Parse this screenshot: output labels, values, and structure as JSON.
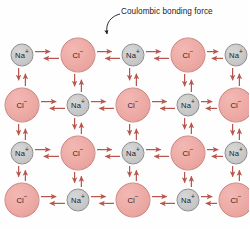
{
  "figure": {
    "width": 249,
    "height": 229,
    "background": "#fefefe"
  },
  "annotation": {
    "label": "Coulombic bonding force",
    "leader_line": {
      "text_anchor_x": 120,
      "text_anchor_y": 14,
      "arrow_tip_x": 108,
      "arrow_tip_y": 40,
      "color": "#1b1b1b"
    }
  },
  "colors": {
    "cation_fill": "#c9c9c9",
    "cation_stroke": "#8d8d8d",
    "anion_fill": "#edaaa5",
    "anion_stroke": "#c8817c",
    "arrow": "#b8564e",
    "text": "#20201f",
    "leader": "#1b1b1b"
  },
  "legend": {
    "cation_symbol": "Na",
    "cation_charge": "+",
    "anion_symbol": "Cl",
    "anion_charge": "−"
  },
  "lattice": {
    "rows": 4,
    "columns": 5,
    "cation_radius": 11.5,
    "anion_radius": 17.5,
    "column_x": [
      22,
      78,
      133,
      188,
      236
    ],
    "row_y": [
      55,
      105,
      153,
      200
    ],
    "ions": [
      [
        {
          "species": "Na+",
          "type": "cation",
          "label": "Na",
          "charge": "+",
          "x": 22,
          "y": 55,
          "r": 11.5
        },
        {
          "species": "Cl-",
          "type": "anion",
          "label": "Cl",
          "charge": "−",
          "x": 78,
          "y": 55,
          "r": 17.5
        },
        {
          "species": "Na+",
          "type": "cation",
          "label": "Na",
          "charge": "+",
          "x": 133,
          "y": 55,
          "r": 11.5
        },
        {
          "species": "Cl-",
          "type": "anion",
          "label": "Cl",
          "charge": "−",
          "x": 188,
          "y": 55,
          "r": 17.5
        },
        {
          "species": "Na+",
          "type": "cation",
          "label": "Na",
          "charge": "+",
          "x": 236,
          "y": 55,
          "r": 11.5
        }
      ],
      [
        {
          "species": "Cl-",
          "type": "anion",
          "label": "Cl",
          "charge": "−",
          "x": 22,
          "y": 105,
          "r": 17.5
        },
        {
          "species": "Na+",
          "type": "cation",
          "label": "Na",
          "charge": "+",
          "x": 78,
          "y": 105,
          "r": 11.5
        },
        {
          "species": "Cl-",
          "type": "anion",
          "label": "Cl",
          "charge": "−",
          "x": 133,
          "y": 105,
          "r": 17.5
        },
        {
          "species": "Na+",
          "type": "cation",
          "label": "Na",
          "charge": "+",
          "x": 188,
          "y": 105,
          "r": 11.5
        },
        {
          "species": "Cl-",
          "type": "anion",
          "label": "Cl",
          "charge": "−",
          "x": 236,
          "y": 105,
          "r": 17.5
        }
      ],
      [
        {
          "species": "Na+",
          "type": "cation",
          "label": "Na",
          "charge": "+",
          "x": 22,
          "y": 153,
          "r": 11.5
        },
        {
          "species": "Cl-",
          "type": "anion",
          "label": "Cl",
          "charge": "−",
          "x": 78,
          "y": 153,
          "r": 17.5
        },
        {
          "species": "Na+",
          "type": "cation",
          "label": "Na",
          "charge": "+",
          "x": 133,
          "y": 153,
          "r": 11.5
        },
        {
          "species": "Cl-",
          "type": "anion",
          "label": "Cl",
          "charge": "−",
          "x": 188,
          "y": 153,
          "r": 17.5
        },
        {
          "species": "Na+",
          "type": "cation",
          "label": "Na",
          "charge": "+",
          "x": 236,
          "y": 153,
          "r": 11.5
        }
      ],
      [
        {
          "species": "Cl-",
          "type": "anion",
          "label": "Cl",
          "charge": "−",
          "x": 22,
          "y": 200,
          "r": 17.5
        },
        {
          "species": "Na+",
          "type": "cation",
          "label": "Na",
          "charge": "+",
          "x": 78,
          "y": 200,
          "r": 11.5
        },
        {
          "species": "Cl-",
          "type": "anion",
          "label": "Cl",
          "charge": "−",
          "x": 133,
          "y": 200,
          "r": 17.5
        },
        {
          "species": "Na+",
          "type": "cation",
          "label": "Na",
          "charge": "+",
          "x": 188,
          "y": 200,
          "r": 11.5
        },
        {
          "species": "Cl-",
          "type": "anion",
          "label": "Cl",
          "charge": "−",
          "x": 236,
          "y": 200,
          "r": 17.5
        }
      ]
    ]
  },
  "bonds": {
    "note": "Each adjacent ion pair is joined by a pair of opposed arrows indicating mutual attraction",
    "horizontal_pairs": 16,
    "vertical_pairs": 15,
    "arrow_style": "double-headed-opposed"
  }
}
